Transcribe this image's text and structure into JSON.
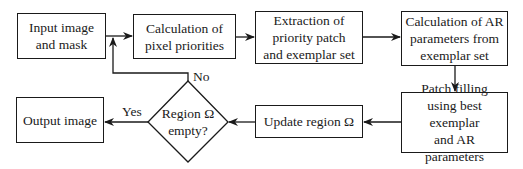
{
  "nodes": {
    "input": {
      "line1": "Input image",
      "line2": "and mask"
    },
    "priorities": {
      "line1": "Calculation of",
      "line2": "pixel priorities"
    },
    "extraction": {
      "line1": "Extraction of",
      "line2": "priority patch",
      "line3": "and exemplar set"
    },
    "ar_params": {
      "line1": "Calculation of AR",
      "line2": "parameters from",
      "line3": "exemplar set"
    },
    "patch_filling": {
      "line1": "Patch filling",
      "line2": "using best exemplar",
      "line3": "and AR parameters"
    },
    "update": {
      "line1": "Update region Ω"
    },
    "decision": {
      "line1": "Region Ω",
      "line2": "empty?"
    },
    "output": {
      "line1": "Output image"
    }
  },
  "edge_labels": {
    "yes": "Yes",
    "no": "No"
  },
  "colors": {
    "stroke": "#1a1a1a",
    "background": "#ffffff"
  }
}
